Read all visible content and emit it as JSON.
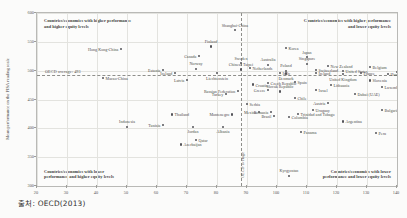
{
  "source_note": "출처: OECD(2013)",
  "axes": {
    "y_label": "Mean performance on the PISA reading scale",
    "y_ticks": [
      "600",
      "550",
      "500",
      "450",
      "400",
      "350",
      "300"
    ],
    "x_ticks": [
      "20",
      "30",
      "40",
      "50",
      "60",
      "70",
      "80",
      "90",
      "100",
      "110",
      "120",
      "130",
      "140"
    ],
    "oecd_avg_h_label": "OECD average: 493",
    "oecd_avg_v_label": "OECD average"
  },
  "quadrants": {
    "top_left": "Countries/economies with higher performance\nand higher equity levels",
    "top_right": "Countries/economies with higher performance\nand lower equity levels",
    "bottom_left": "Countries/economies with lower\nperformance and higher equity levels",
    "bottom_right": "Countries/economies with lower\nperformance and lower equity levels"
  },
  "chart_data": {
    "type": "scatter",
    "title": "",
    "xlabel": "",
    "ylabel": "Mean performance on the PISA reading scale",
    "xlim": [
      20,
      140
    ],
    "ylim": [
      300,
      600
    ],
    "grid": true,
    "legend": "none",
    "reference_lines": {
      "horizontal_y": 493,
      "horizontal_label": "OECD average: 493",
      "vertical_x": 88,
      "vertical_label": "OECD average"
    },
    "points": [
      {
        "name": "Shanghai-China",
        "x": 86,
        "y": 570,
        "pos": "t"
      },
      {
        "name": "Hong Kong-China",
        "x": 48,
        "y": 538,
        "pos": "l"
      },
      {
        "name": "Finland",
        "x": 78,
        "y": 542,
        "pos": "t"
      },
      {
        "name": "Korea",
        "x": 103,
        "y": 540,
        "pos": "r"
      },
      {
        "name": "Canada",
        "x": 74,
        "y": 525,
        "pos": "l"
      },
      {
        "name": "Japan",
        "x": 110,
        "y": 523,
        "pos": "t"
      },
      {
        "name": "Singapore",
        "x": 110,
        "y": 512,
        "pos": "t"
      },
      {
        "name": "New Zealand",
        "x": 117,
        "y": 508,
        "pos": "r"
      },
      {
        "name": "Australia",
        "x": 97,
        "y": 510,
        "pos": "t"
      },
      {
        "name": "Sweden",
        "x": 88,
        "y": 513,
        "pos": "t"
      },
      {
        "name": "Netherlands",
        "x": 91,
        "y": 505,
        "pos": "r"
      },
      {
        "name": "Estonia",
        "x": 62,
        "y": 501,
        "pos": "l"
      },
      {
        "name": "Norway",
        "x": 73,
        "y": 503,
        "pos": "t"
      },
      {
        "name": "Chinese Taipei",
        "x": 88,
        "y": 502,
        "pos": "t"
      },
      {
        "name": "Iceland",
        "x": 66,
        "y": 496,
        "pos": "l"
      },
      {
        "name": "Liechtenstein",
        "x": 80,
        "y": 496,
        "pos": "b"
      },
      {
        "name": "Switzerland",
        "x": 113,
        "y": 501,
        "pos": "r"
      },
      {
        "name": "United States",
        "x": 122,
        "y": 500,
        "pos": "r"
      },
      {
        "name": "Belgium",
        "x": 131,
        "y": 506,
        "pos": "r"
      },
      {
        "name": "Germany",
        "x": 140,
        "y": 498,
        "pos": "r"
      },
      {
        "name": "Poland",
        "x": 103,
        "y": 500,
        "pos": "t"
      },
      {
        "name": "Ireland",
        "x": 113,
        "y": 496,
        "pos": "r"
      },
      {
        "name": "Italy",
        "x": 101,
        "y": 496,
        "pos": "r"
      },
      {
        "name": "Denmark",
        "x": 103,
        "y": 495,
        "pos": "b"
      },
      {
        "name": "United Kingdom",
        "x": 122,
        "y": 494,
        "pos": "b"
      },
      {
        "name": "France",
        "x": 128,
        "y": 496,
        "pos": "r"
      },
      {
        "name": "Hungary",
        "x": 137,
        "y": 494,
        "pos": "r"
      },
      {
        "name": "Latvia",
        "x": 70,
        "y": 484,
        "pos": "l"
      },
      {
        "name": "Croatia",
        "x": 92,
        "y": 476,
        "pos": "r"
      },
      {
        "name": "Spain",
        "x": 106,
        "y": 481,
        "pos": "r"
      },
      {
        "name": "Czech Republic",
        "x": 97,
        "y": 478,
        "pos": "r"
      },
      {
        "name": "Lithuania",
        "x": 118,
        "y": 475,
        "pos": "r"
      },
      {
        "name": "Luxembourg",
        "x": 135,
        "y": 472,
        "pos": "r"
      },
      {
        "name": "Slovenia",
        "x": 131,
        "y": 483,
        "pos": "r"
      },
      {
        "name": "Russian Federation",
        "x": 87,
        "y": 465,
        "pos": "l"
      },
      {
        "name": "Serbia",
        "x": 90,
        "y": 442,
        "pos": "r"
      },
      {
        "name": "Macao-China",
        "x": 42,
        "y": 487,
        "pos": "r"
      },
      {
        "name": "Greece",
        "x": 97,
        "y": 466,
        "pos": "l"
      },
      {
        "name": "Slovak Republic",
        "x": 101,
        "y": 464,
        "pos": "t"
      },
      {
        "name": "Israel",
        "x": 113,
        "y": 466,
        "pos": "r"
      },
      {
        "name": "Turkey",
        "x": 83,
        "y": 460,
        "pos": "l"
      },
      {
        "name": "Chile",
        "x": 106,
        "y": 452,
        "pos": "r"
      },
      {
        "name": "Dubai (UAE)",
        "x": 126,
        "y": 460,
        "pos": "r"
      },
      {
        "name": "Bulgaria",
        "x": 135,
        "y": 432,
        "pos": "r"
      },
      {
        "name": "Uruguay",
        "x": 112,
        "y": 432,
        "pos": "r"
      },
      {
        "name": "Romania",
        "x": 98,
        "y": 428,
        "pos": "l"
      },
      {
        "name": "Austria",
        "x": 117,
        "y": 444,
        "pos": "l"
      },
      {
        "name": "Mexico",
        "x": 94,
        "y": 428,
        "pos": "l"
      },
      {
        "name": "Brazil",
        "x": 99,
        "y": 421,
        "pos": "l"
      },
      {
        "name": "Trinidad and Tobago",
        "x": 107,
        "y": 425,
        "pos": "r"
      },
      {
        "name": "Colombia",
        "x": 104,
        "y": 419,
        "pos": "r"
      },
      {
        "name": "Montenegro",
        "x": 85,
        "y": 424,
        "pos": "l"
      },
      {
        "name": "Argentina",
        "x": 122,
        "y": 412,
        "pos": "r"
      },
      {
        "name": "Albania",
        "x": 82,
        "y": 403,
        "pos": "b"
      },
      {
        "name": "Thailand",
        "x": 65,
        "y": 424,
        "pos": "r"
      },
      {
        "name": "Tunisia",
        "x": 62,
        "y": 406,
        "pos": "l"
      },
      {
        "name": "Jordan",
        "x": 72,
        "y": 403,
        "pos": "b"
      },
      {
        "name": "Indonesia",
        "x": 50,
        "y": 403,
        "pos": "t"
      },
      {
        "name": "Qatar",
        "x": 73,
        "y": 380,
        "pos": "r"
      },
      {
        "name": "Azerbaijan",
        "x": 68,
        "y": 372,
        "pos": "r"
      },
      {
        "name": "Kyrgyzstan",
        "x": 104,
        "y": 318,
        "pos": "t"
      },
      {
        "name": "Panama",
        "x": 108,
        "y": 393,
        "pos": "r"
      },
      {
        "name": "Peru",
        "x": 133,
        "y": 392,
        "pos": "r"
      }
    ]
  }
}
